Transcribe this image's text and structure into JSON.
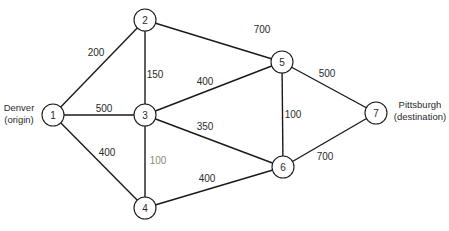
{
  "diagram": {
    "type": "network",
    "title": "",
    "nodes": [
      {
        "id": "1",
        "label": "1",
        "x": 53,
        "y": 115
      },
      {
        "id": "2",
        "label": "2",
        "x": 145,
        "y": 20
      },
      {
        "id": "3",
        "label": "3",
        "x": 145,
        "y": 115
      },
      {
        "id": "4",
        "label": "4",
        "x": 145,
        "y": 208
      },
      {
        "id": "5",
        "label": "5",
        "x": 282,
        "y": 62
      },
      {
        "id": "6",
        "label": "6",
        "x": 283,
        "y": 167
      },
      {
        "id": "7",
        "label": "7",
        "x": 376,
        "y": 113
      }
    ],
    "edges": [
      {
        "from": "1",
        "to": "2",
        "weight": "200",
        "lx": 96,
        "ly": 52
      },
      {
        "from": "1",
        "to": "3",
        "weight": "500",
        "lx": 104,
        "ly": 108
      },
      {
        "from": "1",
        "to": "4",
        "weight": "400",
        "lx": 107,
        "ly": 152
      },
      {
        "from": "2",
        "to": "3",
        "weight": "150",
        "lx": 155,
        "ly": 74
      },
      {
        "from": "2",
        "to": "5",
        "weight": "700",
        "lx": 262,
        "ly": 29
      },
      {
        "from": "3",
        "to": "5",
        "weight": "400",
        "lx": 205,
        "ly": 81
      },
      {
        "from": "3",
        "to": "6",
        "weight": "350",
        "lx": 205,
        "ly": 126
      },
      {
        "from": "3",
        "to": "4",
        "weight": "100",
        "lx": 158,
        "ly": 160,
        "faded": true
      },
      {
        "from": "5",
        "to": "6",
        "weight": "100",
        "lx": 293,
        "ly": 114
      },
      {
        "from": "5",
        "to": "7",
        "weight": "500",
        "lx": 327,
        "ly": 73
      },
      {
        "from": "4",
        "to": "6",
        "weight": "400",
        "lx": 207,
        "ly": 178
      },
      {
        "from": "6",
        "to": "7",
        "weight": "700",
        "lx": 325,
        "ly": 156
      }
    ],
    "annotations": {
      "origin": {
        "line1": "Denver",
        "line2": "(origin)",
        "x": 19,
        "y1": 111,
        "y2": 123
      },
      "destination": {
        "line1": "Pittsburgh",
        "line2": "(destination)",
        "x": 420,
        "y1": 108,
        "y2": 120
      }
    },
    "node_radius": 11
  }
}
